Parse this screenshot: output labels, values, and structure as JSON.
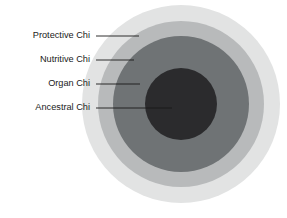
{
  "figure": {
    "background_color": "#ffffff",
    "caption": ""
  },
  "chart_data": {
    "type": "pie",
    "title": "",
    "subtitle": "",
    "xlabel": "",
    "ylabel": "",
    "legend_position": "left-callout-labels",
    "grid": false,
    "center": {
      "x": 181,
      "y": 104
    },
    "categories": [
      "Protective Chi",
      "Nutritive Chi",
      "Organ Chi",
      "Ancestral Chi"
    ],
    "values": [
      99,
      83,
      68,
      36
    ],
    "series": [
      {
        "name": "Concentric ring outer radius (px)",
        "values": [
          99,
          83,
          68,
          36
        ]
      }
    ],
    "rings": [
      {
        "label": "Protective Chi",
        "order": 1,
        "radius": 99,
        "color": "#e2e3e3",
        "label_x": 90,
        "label_y": 36,
        "leader_x1": 96,
        "leader_x2": 139,
        "leader_y": 36
      },
      {
        "label": "Nutritive Chi",
        "order": 2,
        "radius": 83,
        "color": "#b8babb",
        "label_x": 90,
        "label_y": 60,
        "leader_x1": 96,
        "leader_x2": 134,
        "leader_y": 60
      },
      {
        "label": "Organ Chi",
        "order": 3,
        "radius": 68,
        "color": "#6f7375",
        "label_x": 90,
        "label_y": 84,
        "leader_x1": 96,
        "leader_x2": 140,
        "leader_y": 84
      },
      {
        "label": "Ancestral Chi",
        "order": 4,
        "radius": 36,
        "color": "#2b2b2d",
        "label_x": 90,
        "label_y": 108,
        "leader_x1": 96,
        "leader_x2": 172,
        "leader_y": 108
      }
    ],
    "annotations": [
      {
        "text": "Protective Chi"
      },
      {
        "text": "Nutritive Chi"
      },
      {
        "text": "Organ Chi"
      },
      {
        "text": "Ancestral Chi"
      }
    ]
  },
  "colors": {
    "protective": "#e2e3e3",
    "nutritive": "#b8babb",
    "organ": "#6f7375",
    "ancestral": "#2b2b2d",
    "label_text": "#1a1a1a",
    "leader": "#1a1a1a",
    "background": "#ffffff"
  }
}
